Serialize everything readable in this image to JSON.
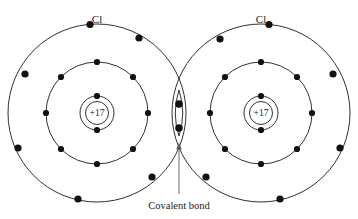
{
  "diagram": {
    "title_visible": false,
    "background_color": "#ffffff",
    "stroke_color": "#1a1a1a",
    "electron_color": "#111111",
    "leader_color": "#5a5a5a",
    "atoms": [
      {
        "id": "left-atom",
        "element_label": "Cl",
        "nucleus_label": "+17",
        "center": {
          "x": 97,
          "y": 113
        },
        "label_position": {
          "x": 97,
          "y": 23
        },
        "shells": [
          {
            "name": "inner-shell",
            "radius": 17,
            "electron_count": 2,
            "electron_angles_deg": [
              270,
              90
            ]
          },
          {
            "name": "middle-shell",
            "radius": 51,
            "electron_count": 8,
            "electron_angles_deg": [
              270,
              315,
              0,
              45,
              90,
              135,
              180,
              225
            ]
          },
          {
            "name": "outer-shell",
            "radius": 89,
            "electron_count": 8,
            "electron_angles_deg": [
              268,
              303,
              338,
              18,
              62,
              97,
              132,
              200
            ]
          }
        ]
      },
      {
        "id": "right-atom",
        "element_label": "Cl",
        "nucleus_label": "+17",
        "center": {
          "x": 261,
          "y": 113
        },
        "label_position": {
          "x": 261,
          "y": 23
        },
        "shells": [
          {
            "name": "inner-shell",
            "radius": 17,
            "electron_count": 2,
            "electron_angles_deg": [
              270,
              90
            ]
          },
          {
            "name": "middle-shell",
            "radius": 51,
            "electron_count": 8,
            "electron_angles_deg": [
              270,
              315,
              0,
              45,
              90,
              135,
              180,
              225
            ]
          },
          {
            "name": "outer-shell",
            "radius": 89,
            "electron_count": 8,
            "electron_angles_deg": [
              272,
              237,
              202,
              162,
              118,
              83,
              48,
              340
            ]
          }
        ]
      }
    ],
    "bond": {
      "name": "covalent-bond",
      "caption": "Covalent bond",
      "caption_position": {
        "x": 179,
        "y": 206
      },
      "shared_electrons": 2,
      "shared_electron_positions": [
        {
          "x": 179,
          "y": 104
        },
        {
          "x": 179,
          "y": 128
        }
      ],
      "overlap_center": {
        "x": 179,
        "y": 113
      },
      "leader_from": {
        "x": 179,
        "y": 194
      },
      "leader_to": {
        "x": 179,
        "y": 146
      }
    },
    "electron_dot_radius": 3.1,
    "nucleus_circle_radius": 11.5
  }
}
